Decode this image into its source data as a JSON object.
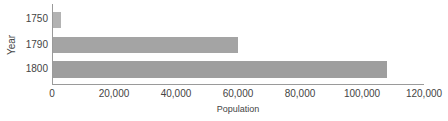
{
  "chart_data": {
    "type": "bar",
    "orientation": "horizontal",
    "title": "",
    "xlabel": "Population",
    "ylabel": "Year",
    "categories": [
      "1750",
      "1790",
      "1800"
    ],
    "values": [
      3000,
      60000,
      108000
    ],
    "xlim": [
      0,
      120000
    ],
    "xticks": [
      "0",
      "20,000",
      "40,000",
      "60,000",
      "80,000",
      "100,000",
      "120,000"
    ],
    "grid": false,
    "legend": null,
    "colors": [
      "#b3b3b3",
      "#a4a4a4",
      "#9e9e9e"
    ]
  }
}
